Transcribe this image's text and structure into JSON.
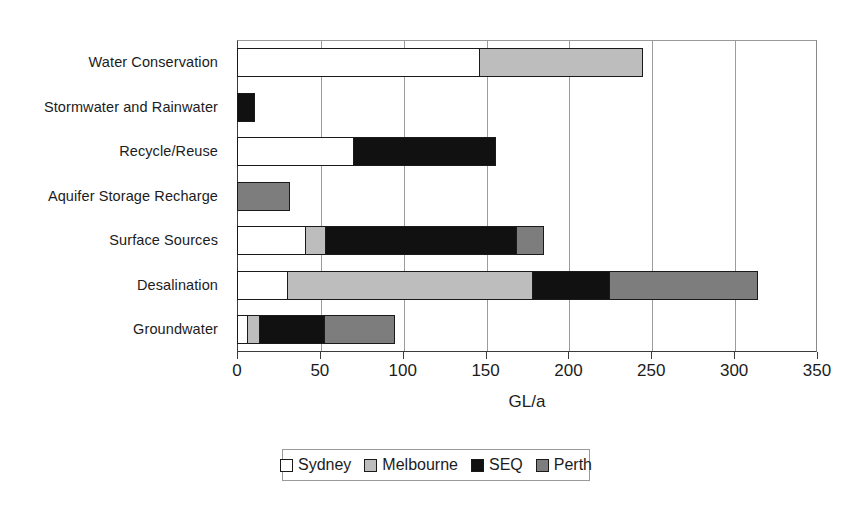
{
  "chart_data": {
    "type": "bar",
    "orientation": "horizontal",
    "stacked": true,
    "title": "",
    "xlabel": "GL/a",
    "ylabel": "",
    "xlim": [
      0,
      350
    ],
    "xticks": [
      0,
      50,
      100,
      150,
      200,
      250,
      300,
      350
    ],
    "xtick_labels": [
      "0",
      "50",
      "100",
      "150",
      "200",
      "250",
      "300",
      "350"
    ],
    "grid": "vertical",
    "legend_position": "bottom",
    "categories": [
      "Water Conservation",
      "Stormwater and Rainwater",
      "Recycle/Reuse",
      "Aquifer Storage Recharge",
      "Surface Sources",
      "Desalination",
      "Groundwater"
    ],
    "series": [
      {
        "name": "Sydney",
        "color": "#ffffff",
        "values": [
          147,
          0,
          71,
          0,
          42,
          31,
          7
        ]
      },
      {
        "name": "Melbourne",
        "color": "#bdbdbd",
        "values": [
          99,
          0,
          0,
          0,
          13,
          149,
          8
        ]
      },
      {
        "name": "SEQ",
        "color": "#111111",
        "values": [
          0,
          11,
          86,
          0,
          116,
          47,
          40
        ]
      },
      {
        "name": "Perth",
        "color": "#7d7d7d",
        "values": [
          0,
          0,
          0,
          32,
          17,
          90,
          43
        ]
      }
    ],
    "totals": [
      246,
      11,
      157,
      32,
      188,
      317,
      98
    ]
  },
  "legend": {
    "entries": [
      {
        "label": "Sydney",
        "icon": "legend-swatch-sydney"
      },
      {
        "label": "Melbourne",
        "icon": "legend-swatch-melbourne"
      },
      {
        "label": "SEQ",
        "icon": "legend-swatch-seq"
      },
      {
        "label": "Perth",
        "icon": "legend-swatch-perth"
      }
    ]
  }
}
